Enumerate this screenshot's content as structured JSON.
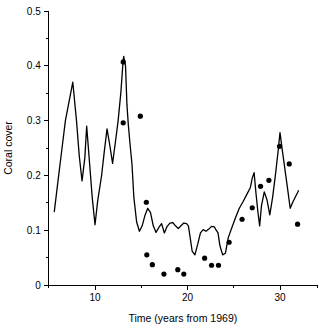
{
  "chart_data": {
    "type": "line",
    "title": "",
    "xlabel": "Time (years from 1969)",
    "ylabel": "Coral cover",
    "xlim": [
      5,
      34
    ],
    "ylim": [
      0,
      0.5
    ],
    "grid": false,
    "legend": false,
    "x_major_ticks": [
      10,
      20,
      30
    ],
    "x_major_tick_labels": [
      "10",
      "20",
      "30"
    ],
    "x_minor_ticks": [
      5,
      15,
      25,
      34
    ],
    "y_major_ticks": [
      0,
      0.1,
      0.2,
      0.3,
      0.4,
      0.5
    ],
    "y_major_tick_labels": [
      "0",
      "0.1",
      "0.2",
      "0.3",
      "0.4",
      "0.5"
    ],
    "y_minor_ticks": [
      0.05,
      0.15,
      0.25,
      0.35,
      0.45
    ],
    "series": [
      {
        "name": "model-line",
        "type": "line",
        "x": [
          5.6,
          6.0,
          6.4,
          6.8,
          7.2,
          7.6,
          8.0,
          8.3,
          8.6,
          8.9,
          9.1,
          9.4,
          9.7,
          10.0,
          10.3,
          10.7,
          11.0,
          11.3,
          11.6,
          11.9,
          12.2,
          12.5,
          12.8,
          13.0,
          13.1,
          13.3,
          13.45,
          13.6,
          13.8,
          14.0,
          14.2,
          14.5,
          14.8,
          15.1,
          15.4,
          15.7,
          16.0,
          16.3,
          16.6,
          16.9,
          17.2,
          17.5,
          17.8,
          18.1,
          18.4,
          18.7,
          19.0,
          19.3,
          19.6,
          19.9,
          20.1,
          20.3,
          20.5,
          20.8,
          21.1,
          21.4,
          21.7,
          22.0,
          22.3,
          22.6,
          22.9,
          23.1,
          23.3,
          23.5,
          23.8,
          24.1,
          24.4,
          24.8,
          25.2,
          25.6,
          26.0,
          26.4,
          26.8,
          27.0,
          27.2,
          27.4,
          27.6,
          27.8,
          28.0,
          28.3,
          28.6,
          28.9,
          29.2,
          29.5,
          29.8,
          30.0,
          30.2,
          30.5,
          30.8,
          31.1,
          31.4,
          31.7,
          32.0
        ],
        "y": [
          0.134,
          0.19,
          0.245,
          0.3,
          0.335,
          0.37,
          0.3,
          0.235,
          0.19,
          0.232,
          0.29,
          0.225,
          0.16,
          0.11,
          0.155,
          0.198,
          0.243,
          0.285,
          0.255,
          0.222,
          0.26,
          0.3,
          0.352,
          0.4,
          0.417,
          0.4,
          0.33,
          0.293,
          0.255,
          0.22,
          0.16,
          0.115,
          0.098,
          0.108,
          0.127,
          0.14,
          0.132,
          0.108,
          0.096,
          0.105,
          0.112,
          0.095,
          0.107,
          0.113,
          0.114,
          0.108,
          0.103,
          0.108,
          0.113,
          0.112,
          0.108,
          0.085,
          0.062,
          0.055,
          0.074,
          0.095,
          0.101,
          0.098,
          0.102,
          0.107,
          0.106,
          0.1,
          0.095,
          0.072,
          0.055,
          0.058,
          0.086,
          0.105,
          0.123,
          0.14,
          0.152,
          0.165,
          0.178,
          0.195,
          0.205,
          0.168,
          0.135,
          0.108,
          0.145,
          0.17,
          0.155,
          0.128,
          0.16,
          0.2,
          0.245,
          0.278,
          0.252,
          0.215,
          0.178,
          0.14,
          0.152,
          0.162,
          0.172
        ]
      },
      {
        "name": "observations",
        "type": "scatter",
        "points": [
          {
            "x": 13.05,
            "y": 0.296
          },
          {
            "x": 13.05,
            "y": 0.407
          },
          {
            "x": 14.9,
            "y": 0.308
          },
          {
            "x": 15.55,
            "y": 0.151
          },
          {
            "x": 15.6,
            "y": 0.055
          },
          {
            "x": 16.2,
            "y": 0.037
          },
          {
            "x": 17.45,
            "y": 0.02
          },
          {
            "x": 18.95,
            "y": 0.028
          },
          {
            "x": 19.6,
            "y": 0.02
          },
          {
            "x": 21.85,
            "y": 0.049
          },
          {
            "x": 22.6,
            "y": 0.036
          },
          {
            "x": 23.35,
            "y": 0.036
          },
          {
            "x": 24.5,
            "y": 0.078
          },
          {
            "x": 25.9,
            "y": 0.12
          },
          {
            "x": 27.0,
            "y": 0.141
          },
          {
            "x": 27.9,
            "y": 0.18
          },
          {
            "x": 28.8,
            "y": 0.191
          },
          {
            "x": 29.95,
            "y": 0.253
          },
          {
            "x": 31.0,
            "y": 0.221
          },
          {
            "x": 31.9,
            "y": 0.111
          }
        ]
      }
    ],
    "colors": {
      "line": "#000000",
      "points": "#000000",
      "axis": "#000000",
      "background": "#ffffff"
    }
  }
}
